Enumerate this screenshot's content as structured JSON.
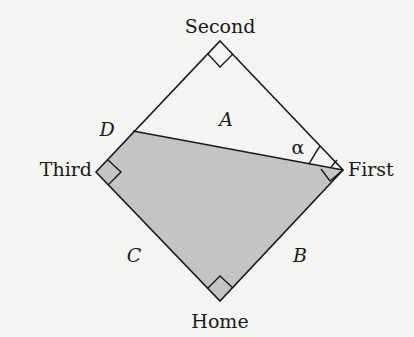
{
  "diagram": {
    "bases": {
      "second": "Second",
      "first": "First",
      "third": "Third",
      "home": "Home"
    },
    "regions": {
      "a": "A",
      "b": "B",
      "c": "C",
      "d": "D"
    },
    "angle": "α",
    "colors": {
      "background": "#f4f4f2",
      "shaded": "#c4c4c4",
      "line": "#1a1a1a"
    }
  }
}
